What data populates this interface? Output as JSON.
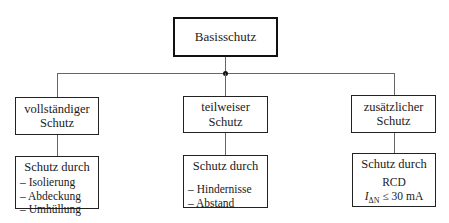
{
  "root": {
    "label": "Basisschutz"
  },
  "columns": [
    {
      "title_lines": [
        "vollständiger",
        "Schutz"
      ],
      "detail": {
        "heading": "Schutz durch",
        "items": [
          "– Isolierung",
          "– Abdeckung",
          "– Umhüllung"
        ]
      }
    },
    {
      "title_lines": [
        "teilweiser",
        "Schutz"
      ],
      "detail": {
        "heading": "Schutz durch",
        "items": [
          "– Hindernisse",
          "– Abstand"
        ]
      }
    },
    {
      "title_lines": [
        "zusätzlicher",
        "Schutz"
      ],
      "detail": {
        "heading": "Schutz durch",
        "line1": "RCD",
        "condition_symbol": "I",
        "condition_subscript": "ΔN",
        "condition_rest": " ≤ 30 mA"
      }
    }
  ]
}
